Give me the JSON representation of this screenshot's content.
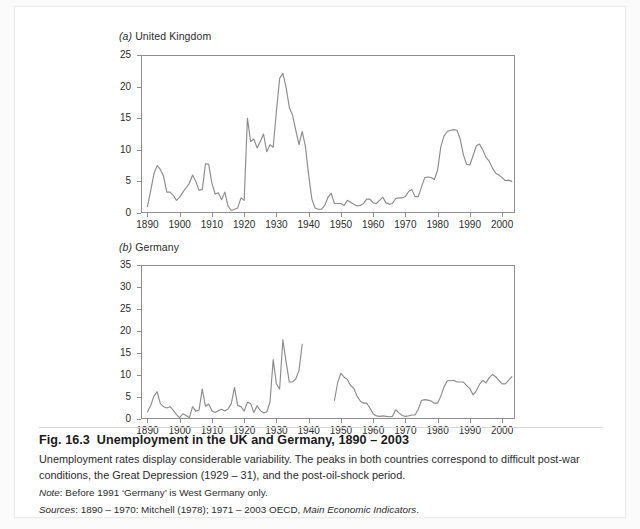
{
  "figure": {
    "label": "Fig. 16.3",
    "title": "Unemployment in the UK and Germany, 1890 – 2003",
    "description": "Unemployment rates display considerable variability. The peaks in both countries correspond to difficult post-war conditions, the Great Depression (1929 – 31), and the post-oil-shock period.",
    "note_lead": "Note",
    "note_text": ": Before 1991 ‘Germany’ is West Germany only.",
    "sources_lead": "Sources",
    "sources_text": ": 1890 – 1970: Mitchell (1978); 1971 – 2003 OECD, ",
    "sources_italic": "Main Economic Indicators",
    "sources_tail": "."
  },
  "panel_a": {
    "marker": "(a)",
    "name": "United Kingdom"
  },
  "panel_b": {
    "marker": "(b)",
    "name": "Germany"
  },
  "colors": {
    "line": "#8c8c8c",
    "axis": "#8e8e8e",
    "text": "#2b2b2b",
    "card": "#ffffff",
    "page": "#fbfbfb"
  },
  "chart_data": [
    {
      "type": "line",
      "id": "uk",
      "title": "(a) United Kingdom",
      "xlabel": "",
      "ylabel": "",
      "xlim": [
        1888,
        2004
      ],
      "ylim": [
        0,
        25
      ],
      "yticks": [
        0,
        5,
        10,
        15,
        20,
        25
      ],
      "xticks": [
        1890,
        1900,
        1910,
        1920,
        1930,
        1940,
        1950,
        1960,
        1970,
        1980,
        1990,
        2000
      ],
      "grid": false,
      "legend": "none",
      "series": [
        {
          "name": "UK unemployment rate (%)",
          "x": [
            1890,
            1891,
            1892,
            1893,
            1894,
            1895,
            1896,
            1897,
            1898,
            1899,
            1900,
            1901,
            1902,
            1903,
            1904,
            1905,
            1906,
            1907,
            1908,
            1909,
            1910,
            1911,
            1912,
            1913,
            1914,
            1915,
            1916,
            1917,
            1918,
            1919,
            1920,
            1921,
            1922,
            1923,
            1924,
            1925,
            1926,
            1927,
            1928,
            1929,
            1930,
            1931,
            1932,
            1933,
            1934,
            1935,
            1936,
            1937,
            1938,
            1939,
            1940,
            1941,
            1942,
            1943,
            1944,
            1945,
            1946,
            1947,
            1948,
            1949,
            1950,
            1951,
            1952,
            1953,
            1954,
            1955,
            1956,
            1957,
            1958,
            1959,
            1960,
            1961,
            1962,
            1963,
            1964,
            1965,
            1966,
            1967,
            1968,
            1969,
            1970,
            1971,
            1972,
            1973,
            1974,
            1975,
            1976,
            1977,
            1978,
            1979,
            1980,
            1981,
            1982,
            1983,
            1984,
            1985,
            1986,
            1987,
            1988,
            1989,
            1990,
            1991,
            1992,
            1993,
            1994,
            1995,
            1996,
            1997,
            1998,
            1999,
            2000,
            2001,
            2002,
            2003
          ],
          "y": [
            1.0,
            3.5,
            6.2,
            7.5,
            6.9,
            5.8,
            3.3,
            3.3,
            2.8,
            2.0,
            2.5,
            3.3,
            4.0,
            4.7,
            6.0,
            5.0,
            3.6,
            3.7,
            7.8,
            7.7,
            4.7,
            3.0,
            3.2,
            2.1,
            3.3,
            1.1,
            0.4,
            0.6,
            0.8,
            2.4,
            2.0,
            15.0,
            11.3,
            11.7,
            10.3,
            11.3,
            12.5,
            9.7,
            10.8,
            10.4,
            16.1,
            21.3,
            22.1,
            19.9,
            16.7,
            15.5,
            13.1,
            10.8,
            12.9,
            10.5,
            6.0,
            2.2,
            0.8,
            0.6,
            0.6,
            1.2,
            2.5,
            3.1,
            1.5,
            1.5,
            1.5,
            1.2,
            2.0,
            1.7,
            1.4,
            1.1,
            1.2,
            1.5,
            2.2,
            2.2,
            1.6,
            1.5,
            2.0,
            2.5,
            1.6,
            1.4,
            1.5,
            2.3,
            2.4,
            2.4,
            2.6,
            3.4,
            3.7,
            2.6,
            2.6,
            4.1,
            5.6,
            5.7,
            5.6,
            5.3,
            6.8,
            10.5,
            12.2,
            12.9,
            13.1,
            13.2,
            13.1,
            11.7,
            9.2,
            7.7,
            7.6,
            9.1,
            10.6,
            10.9,
            10.0,
            8.8,
            8.2,
            7.1,
            6.3,
            6.0,
            5.6,
            5.1,
            5.2,
            5.0
          ]
        }
      ]
    },
    {
      "type": "line",
      "id": "germany",
      "title": "(b) Germany",
      "xlabel": "",
      "ylabel": "",
      "xlim": [
        1888,
        2004
      ],
      "ylim": [
        0,
        35
      ],
      "yticks": [
        0,
        5,
        10,
        15,
        20,
        25,
        30,
        35
      ],
      "xticks": [
        1890,
        1900,
        1910,
        1920,
        1930,
        1940,
        1950,
        1960,
        1970,
        1980,
        1990,
        2000
      ],
      "grid": false,
      "legend": "none",
      "gap": [
        1939,
        1947
      ],
      "series": [
        {
          "name": "Germany unemployment rate (%)",
          "x": [
            1890,
            1891,
            1892,
            1893,
            1894,
            1895,
            1896,
            1897,
            1898,
            1899,
            1900,
            1901,
            1902,
            1903,
            1904,
            1905,
            1906,
            1907,
            1908,
            1909,
            1910,
            1911,
            1912,
            1913,
            1914,
            1915,
            1916,
            1917,
            1918,
            1919,
            1920,
            1921,
            1922,
            1923,
            1924,
            1925,
            1926,
            1927,
            1928,
            1929,
            1930,
            1931,
            1932,
            1933,
            1934,
            1935,
            1936,
            1937,
            1938
          ],
          "y": [
            1.6,
            3.0,
            5.2,
            6.2,
            3.5,
            2.8,
            2.5,
            2.8,
            2.0,
            1.0,
            0.3,
            1.2,
            0.8,
            0.3,
            2.8,
            1.8,
            2.0,
            6.8,
            2.9,
            3.4,
            1.9,
            1.5,
            1.9,
            2.2,
            1.8,
            2.3,
            3.5,
            7.2,
            3.1,
            2.8,
            1.8,
            3.8,
            3.5,
            1.5,
            3.0,
            1.9,
            1.4,
            1.6,
            3.8,
            13.5,
            8.0,
            6.8,
            18.0,
            13.0,
            8.4,
            8.4,
            9.1,
            11.0,
            17.0,
            23.5,
            30.1,
            26.3,
            20.2,
            14.5,
            11.0,
            7.8,
            4.8,
            2.4
          ]
        },
        {
          "name": "Germany unemployment rate (%) post-war",
          "x": [
            1948,
            1949,
            1950,
            1951,
            1952,
            1953,
            1954,
            1955,
            1956,
            1957,
            1958,
            1959,
            1960,
            1961,
            1962,
            1963,
            1964,
            1965,
            1966,
            1967,
            1968,
            1969,
            1970,
            1971,
            1972,
            1973,
            1974,
            1975,
            1976,
            1977,
            1978,
            1979,
            1980,
            1981,
            1982,
            1983,
            1984,
            1985,
            1986,
            1987,
            1988,
            1989,
            1990,
            1991,
            1992,
            1993,
            1994,
            1995,
            1996,
            1997,
            1998,
            1999,
            2000,
            2001,
            2002,
            2003
          ],
          "y": [
            4.2,
            8.3,
            10.4,
            9.5,
            9.0,
            7.6,
            7.0,
            5.2,
            4.1,
            3.6,
            3.6,
            2.5,
            1.2,
            0.7,
            0.6,
            0.7,
            0.6,
            0.5,
            0.6,
            2.1,
            1.4,
            0.8,
            0.6,
            0.7,
            0.9,
            0.9,
            2.2,
            4.2,
            4.4,
            4.3,
            4.1,
            3.6,
            3.6,
            5.2,
            7.3,
            8.7,
            8.7,
            8.8,
            8.4,
            8.4,
            8.4,
            7.6,
            6.9,
            5.5,
            6.4,
            7.9,
            8.8,
            8.2,
            9.4,
            10.1,
            9.6,
            8.8,
            8.0,
            8.0,
            8.8,
            9.6
          ]
        }
      ]
    }
  ]
}
